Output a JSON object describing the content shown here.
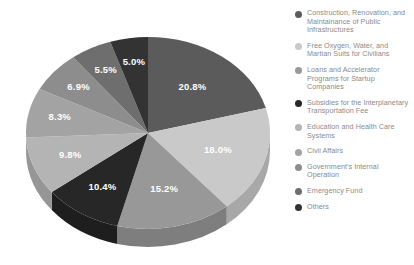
{
  "chart_data": {
    "type": "pie",
    "title": "",
    "subtitle": "",
    "xlabel": "",
    "ylabel": "",
    "legend_position": "right",
    "grid": false,
    "three_d": true,
    "start_angle_deg": 0,
    "direction": "clockwise",
    "categories": [
      "Construction, Renovation, and Maintainance of Public Infrastructures",
      "Free Oxygen, Water, and Martian Suits for Civilians",
      "Loans and Accelerator Programs for Startup Companies",
      "Subsidies for the Interplanetary Transportation Fee",
      "Education and Health Care Systems",
      "Civil Affairs",
      "Government's Internal Operation",
      "Emergency Fund",
      "Others"
    ],
    "values": [
      20.8,
      18.0,
      15.2,
      10.4,
      9.8,
      8.3,
      6.9,
      5.5,
      5.0
    ],
    "value_labels": [
      "20.8%",
      "18.0%",
      "15.2%",
      "10.4%",
      "9.8%",
      "8.3%",
      "6.9%",
      "5.5%",
      "5.0%"
    ],
    "colors": [
      "#5b5b5b",
      "#c9c9c9",
      "#989898",
      "#272727",
      "#b4b4b4",
      "#a3a3a3",
      "#8d8d8d",
      "#6e6e6e",
      "#333333"
    ],
    "side_colors": [
      "#4a4a4a",
      "#a8a8a8",
      "#7e7e7e",
      "#1e1e1e",
      "#969696",
      "#888888",
      "#767676",
      "#5c5c5c",
      "#2a2a2a"
    ],
    "label_color": "#ffffff",
    "background": "#ffffff"
  },
  "legend": {
    "items": [
      {
        "label": "Construction, Renovation, and Maintainance of Public Infrastructures",
        "color": "#5b5b5b"
      },
      {
        "label": "Free Oxygen, Water, and Martian Suits for Civilians",
        "color": "#c9c9c9"
      },
      {
        "label": "Loans and Accelerator Programs for Startup Companies",
        "color": "#989898"
      },
      {
        "label": "Subsidies for the Interplanetary Transportation Fee",
        "color": "#272727"
      },
      {
        "label": "Education and Health Care Systems",
        "color": "#b4b4b4"
      },
      {
        "label": "Civil Affairs",
        "color": "#a3a3a3"
      },
      {
        "label": "Government's Internal Operation",
        "color": "#8d8d8d"
      },
      {
        "label": "Emergency Fund",
        "color": "#6e6e6e"
      },
      {
        "label": "Others",
        "color": "#333333"
      }
    ]
  }
}
